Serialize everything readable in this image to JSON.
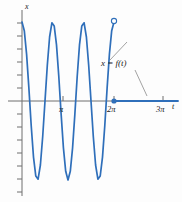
{
  "figure": {
    "type": "function-graph",
    "background": "#fdfdfd",
    "curve_color": "#2f6fba",
    "axis_color": "#6f6f6f",
    "leader_color": "#8a8a8a",
    "text_color": "#1a1a1a"
  },
  "axes": {
    "x_axis_label": "t",
    "y_axis_label": "x",
    "x_ticks": [
      {
        "value": "π",
        "px": 63
      },
      {
        "value": "2π",
        "px": 114
      },
      {
        "value": "3π",
        "px": 163
      }
    ],
    "y_ticks_count_above": 6,
    "y_ticks_count_below": 7,
    "origin_px": {
      "x": 22,
      "y": 101
    }
  },
  "annotations": {
    "curve_label": "x = f(t)",
    "open_point": {
      "t": "2π",
      "x": "1",
      "px": {
        "x": 114,
        "y": 22
      }
    },
    "closed_point": {
      "t": "2π",
      "x": "0",
      "px": {
        "x": 114,
        "y": 101
      }
    }
  },
  "chart_data": {
    "type": "line",
    "title": "",
    "xlabel": "t",
    "ylabel": "x",
    "xlim": [
      -0.15,
      3.45
    ],
    "ylim": [
      -1.45,
      1.15
    ],
    "grid": false,
    "legend": "none",
    "x_tick_labels": [
      "π",
      "2π",
      "3π"
    ],
    "x_tick_values": [
      1,
      2,
      3
    ],
    "series": [
      {
        "name": "x = f(t), 0 ≤ t < 2π",
        "description": "cosine-like oscillation of 3 periods, amplitude 1, on 0 to 2pi",
        "x": [
          0.0,
          0.05,
          0.1,
          0.15,
          0.2,
          0.25,
          0.3,
          0.35,
          0.4,
          0.45,
          0.5,
          0.55,
          0.6,
          0.65,
          0.7,
          0.75,
          0.8,
          0.85,
          0.9,
          0.95,
          1.0,
          1.05,
          1.1,
          1.15,
          1.2,
          1.25,
          1.3,
          1.35,
          1.4,
          1.45,
          1.5,
          1.55,
          1.6,
          1.65,
          1.7,
          1.75,
          1.8,
          1.85,
          1.9,
          1.95,
          2.0
        ],
        "y": [
          1.0,
          0.89,
          0.59,
          0.16,
          -0.31,
          -0.71,
          -0.95,
          -0.99,
          -0.81,
          -0.45,
          0.0,
          0.45,
          0.81,
          0.99,
          0.95,
          0.71,
          0.31,
          -0.16,
          -0.59,
          -0.89,
          -1.0,
          -0.89,
          -0.59,
          -0.16,
          0.31,
          0.71,
          0.95,
          0.99,
          0.81,
          0.45,
          0.0,
          -0.45,
          -0.81,
          -0.99,
          -0.95,
          -0.71,
          -0.31,
          0.16,
          0.59,
          0.89,
          1.0
        ]
      },
      {
        "name": "x = 0, t ≥ 2π",
        "description": "flat zero line to the right of 2pi",
        "x": [
          2.0,
          3.45
        ],
        "y": [
          0.0,
          0.0
        ]
      }
    ]
  }
}
